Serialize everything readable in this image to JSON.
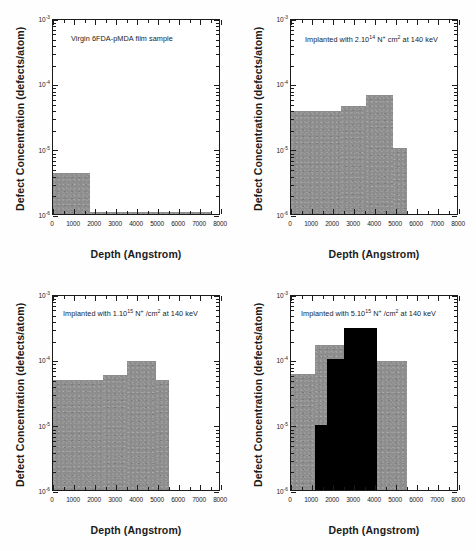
{
  "figure": {
    "axis_titles": {
      "x": "Depth (Angstrom)",
      "y": "Defect Concentration (defects/atom)"
    },
    "x_ticks": [
      "0",
      "1000",
      "2000",
      "3000",
      "4000",
      "5000",
      "6000",
      "7000",
      "8000"
    ],
    "y_ticks": [
      "10",
      "10",
      "10",
      "10"
    ],
    "y_exponents": [
      "-3",
      "-4",
      "-5",
      "-6"
    ]
  },
  "panels": [
    {
      "id": "virgin",
      "annotation_parts": {
        "pre": "Virgin 6FDA-pMDA film sample",
        "sup1": "",
        "mid": "",
        "sup2": "",
        "post": ""
      },
      "annotation_text": "Virgin 6FDA-pMDA film sample"
    },
    {
      "id": "implanted-2e14",
      "annotation_parts": {
        "pre": "Implanted with 2.10",
        "sup1": "14",
        "mid": " N",
        "sup2": "+",
        "post": " cm",
        "sup3": "2",
        "tail": " at 140 keV"
      },
      "annotation_text": "Implanted with 2.10^14 N+ cm^2 at 140 keV"
    },
    {
      "id": "implanted-1e15",
      "annotation_parts": {
        "pre": "Implanted with 1.10",
        "sup1": "15",
        "mid": " N",
        "sup2": "+",
        "post": " /cm",
        "sup3": "2",
        "tail": " at 140 keV"
      },
      "annotation_text": "Implanted with 1.10^15 N+ /cm^2 at 140 keV"
    },
    {
      "id": "implanted-5e15",
      "annotation_parts": {
        "pre": "Implanted with 5.10",
        "sup1": "15",
        "mid": " N",
        "sup2": "+",
        "post": " /cm",
        "sup3": "2",
        "tail": " at 140 keV"
      },
      "annotation_text": "Implanted with 5.10^15 N+ /cm^2 at 140 keV"
    }
  ],
  "chart_data": [
    {
      "type": "bar",
      "panel": "top-left",
      "title": "Virgin 6FDA-pMDA film sample",
      "xlabel": "Depth (Angstrom)",
      "ylabel": "Defect Concentration (defects/atom)",
      "xlim": [
        0,
        8000
      ],
      "ylim": [
        1e-06,
        0.001
      ],
      "yscale": "log",
      "grid": false,
      "legend": "none",
      "bin_edges": [
        0,
        1800,
        7600
      ],
      "values": [
        3.5e-06,
        1.02e-06
      ],
      "colors": [
        "#8d8d8d",
        "#8d8d8d"
      ]
    },
    {
      "type": "bar",
      "panel": "top-right",
      "title": "Implanted with 2.10^14 N+ cm^2 at 140 keV",
      "xlabel": "Depth (Angstrom)",
      "ylabel": "Defect Concentration (defects/atom)",
      "xlim": [
        0,
        8000
      ],
      "ylim": [
        1e-06,
        0.001
      ],
      "yscale": "log",
      "grid": false,
      "legend": "none",
      "bin_edges": [
        0,
        2400,
        3600,
        4900,
        5600
      ],
      "values": [
        3.9e-05,
        4.6e-05,
        6.8e-05,
        1.05e-05
      ],
      "colors": [
        "#8d8d8d",
        "#8d8d8d",
        "#8d8d8d",
        "#8d8d8d"
      ]
    },
    {
      "type": "bar",
      "panel": "bottom-left",
      "title": "Implanted with 1.10^15 N+ /cm^2 at 140 keV",
      "xlabel": "Depth (Angstrom)",
      "ylabel": "Defect Concentration (defects/atom)",
      "xlim": [
        0,
        8000
      ],
      "ylim": [
        1e-06,
        0.001
      ],
      "yscale": "log",
      "grid": false,
      "legend": "none",
      "bin_edges": [
        0,
        2400,
        3550,
        4950,
        5600
      ],
      "values": [
        5e-05,
        6e-05,
        0.0001,
        5e-05
      ],
      "colors": [
        "#8d8d8d",
        "#8d8d8d",
        "#8d8d8d",
        "#8d8d8d"
      ]
    },
    {
      "type": "bar",
      "panel": "bottom-right",
      "title": "Implanted with 5.10^15 N+ /cm^2 at 140 keV",
      "xlabel": "Depth (Angstrom)",
      "ylabel": "Defect Concentration (defects/atom)",
      "xlim": [
        0,
        8000
      ],
      "ylim": [
        1e-06,
        0.001
      ],
      "yscale": "log",
      "grid": false,
      "legend": "none",
      "series": [
        {
          "name": "gray",
          "bin_edges": [
            0,
            1150,
            1750,
            2550,
            4150,
            5600
          ],
          "values": [
            6.2e-05,
            0.000175,
            0.000175,
            0.0001,
            0.0001
          ],
          "color": "#8d8d8d"
        },
        {
          "name": "black",
          "bin_edges": [
            1150,
            1750,
            2550,
            4150
          ],
          "values": [
            1.02e-05,
            0.000105,
            0.00032
          ],
          "color": "#000000"
        }
      ]
    }
  ]
}
